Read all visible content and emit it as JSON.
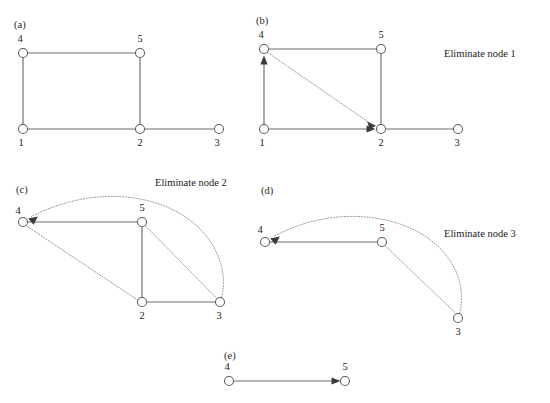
{
  "figure": {
    "width": 550,
    "height": 403,
    "background": "#ffffff",
    "colors": {
      "solid_edge": "#6e6e6e",
      "dotted_edge": "#8a8a8a",
      "node_stroke": "#5a5a5a",
      "node_fill": "#ffffff",
      "arrow_fill": "#3a3a3a",
      "text": "#1a1a1a"
    }
  },
  "panels": {
    "a": {
      "label": "(a)",
      "caption": "",
      "nodes": [
        {
          "id": "4",
          "label": "4",
          "x": 23,
          "y": 53,
          "label_x": 20,
          "label_y": 42
        },
        {
          "id": "5",
          "label": "5",
          "x": 140,
          "y": 53,
          "label_x": 140,
          "label_y": 42
        },
        {
          "id": "1",
          "label": "1",
          "x": 23,
          "y": 129,
          "label_x": 21,
          "label_y": 146
        },
        {
          "id": "2",
          "label": "2",
          "x": 140,
          "y": 129,
          "label_x": 140,
          "label_y": 146
        },
        {
          "id": "3",
          "label": "3",
          "x": 219,
          "y": 129,
          "label_x": 216,
          "label_y": 146
        }
      ],
      "edges": [
        {
          "from": "4",
          "to": "5",
          "style": "solid",
          "arrow": false
        },
        {
          "from": "4",
          "to": "1",
          "style": "solid",
          "arrow": false
        },
        {
          "from": "5",
          "to": "2",
          "style": "solid",
          "arrow": false
        },
        {
          "from": "1",
          "to": "2",
          "style": "solid",
          "arrow": false
        },
        {
          "from": "2",
          "to": "3",
          "style": "solid",
          "arrow": false
        }
      ]
    },
    "b": {
      "label": "(b)",
      "caption": "Eliminate node 1",
      "caption_x": 444,
      "caption_y": 57,
      "nodes": [
        {
          "id": "4",
          "label": "4",
          "x": 264,
          "y": 49,
          "label_x": 261,
          "label_y": 38
        },
        {
          "id": "5",
          "label": "5",
          "x": 381,
          "y": 49,
          "label_x": 381,
          "label_y": 38
        },
        {
          "id": "1",
          "label": "1",
          "x": 264,
          "y": 129,
          "label_x": 262,
          "label_y": 146
        },
        {
          "id": "2",
          "label": "2",
          "x": 381,
          "y": 129,
          "label_x": 381,
          "label_y": 146
        },
        {
          "id": "3",
          "label": "3",
          "x": 458,
          "y": 129,
          "label_x": 456,
          "label_y": 146
        }
      ],
      "edges": [
        {
          "from": "4",
          "to": "5",
          "style": "solid",
          "arrow": false
        },
        {
          "from": "1",
          "to": "4",
          "style": "solid",
          "arrow": true
        },
        {
          "from": "5",
          "to": "2",
          "style": "solid",
          "arrow": false
        },
        {
          "from": "1",
          "to": "2",
          "style": "solid",
          "arrow": true
        },
        {
          "from": "2",
          "to": "3",
          "style": "solid",
          "arrow": false
        },
        {
          "from": "4",
          "to": "2",
          "style": "dotted",
          "arrow": true
        }
      ]
    },
    "c": {
      "label": "(c)",
      "caption": "Eliminate node 2",
      "caption_x": 155,
      "caption_y": 186,
      "nodes": [
        {
          "id": "4",
          "label": "4",
          "x": 23,
          "y": 222,
          "label_x": 18,
          "label_y": 214
        },
        {
          "id": "5",
          "label": "5",
          "x": 142,
          "y": 222,
          "label_x": 142,
          "label_y": 211
        },
        {
          "id": "2",
          "label": "2",
          "x": 142,
          "y": 302,
          "label_x": 142,
          "label_y": 319
        },
        {
          "id": "3",
          "label": "3",
          "x": 220,
          "y": 302,
          "label_x": 218,
          "label_y": 319
        }
      ],
      "edges": [
        {
          "from": "4",
          "to": "5",
          "style": "solid",
          "arrow": false
        },
        {
          "from": "5",
          "to": "2",
          "style": "solid",
          "arrow": false
        },
        {
          "from": "2",
          "to": "3",
          "style": "solid",
          "arrow": false
        },
        {
          "from": "5",
          "to": "3",
          "style": "dotted",
          "arrow": false
        },
        {
          "from": "2",
          "to": "4",
          "style": "dotted",
          "arrow": false
        },
        {
          "from": "3",
          "to": "4",
          "style": "dotted-arc",
          "arrow": true
        }
      ]
    },
    "d": {
      "label": "(d)",
      "caption": "Eliminate node 3",
      "caption_x": 444,
      "caption_y": 237,
      "nodes": [
        {
          "id": "4",
          "label": "4",
          "x": 265,
          "y": 242,
          "label_x": 260,
          "label_y": 233
        },
        {
          "id": "5",
          "label": "5",
          "x": 382,
          "y": 242,
          "label_x": 382,
          "label_y": 231
        },
        {
          "id": "3",
          "label": "3",
          "x": 458,
          "y": 318,
          "label_x": 458,
          "label_y": 335
        }
      ],
      "edges": [
        {
          "from": "4",
          "to": "5",
          "style": "solid",
          "arrow": false
        },
        {
          "from": "5",
          "to": "3",
          "style": "dotted",
          "arrow": false
        },
        {
          "from": "3",
          "to": "4",
          "style": "dotted-arc",
          "arrow": true
        }
      ]
    },
    "e": {
      "label": "(e)",
      "caption": "",
      "nodes": [
        {
          "id": "4",
          "label": "4",
          "x": 229,
          "y": 381,
          "label_x": 227,
          "label_y": 370
        },
        {
          "id": "5",
          "label": "5",
          "x": 345,
          "y": 381,
          "label_x": 345,
          "label_y": 370
        }
      ],
      "edges": [
        {
          "from": "4",
          "to": "5",
          "style": "solid",
          "arrow": true
        }
      ]
    }
  },
  "panel_labels": {
    "a": {
      "text": "(a)",
      "x": 14,
      "y": 28
    },
    "b": {
      "text": "(b)",
      "x": 256,
      "y": 24
    },
    "c": {
      "text": "(c)",
      "x": 16,
      "y": 193
    },
    "d": {
      "text": "(d)",
      "x": 261,
      "y": 194
    },
    "e": {
      "text": "(e)",
      "x": 224,
      "y": 359
    }
  },
  "captions": {
    "b": "Eliminate node 1",
    "c": "Eliminate node 2",
    "d": "Eliminate node 3"
  }
}
